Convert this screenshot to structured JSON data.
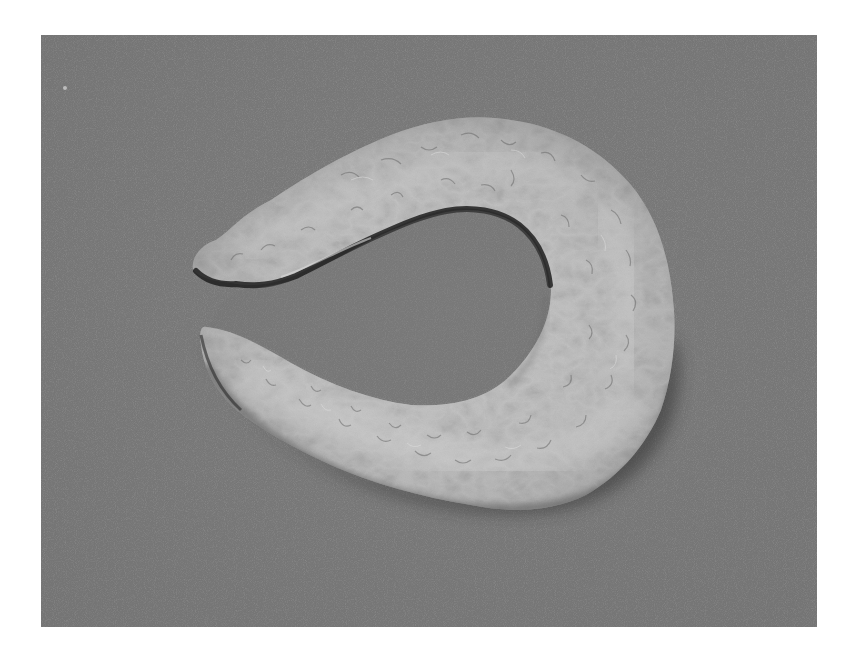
{
  "figure": {
    "alt": "Grayscale photograph of a C-shaped (horseshoe) ring-like specimen on a gray background",
    "colors": {
      "page_background": "#ffffff",
      "photo_background": "#7a7a7a",
      "specimen_highlight": "#cfcfcf",
      "specimen_midtone": "#b4b4b4",
      "specimen_shadow": "#3a3a3a",
      "inner_hole": "#6e6e6e"
    },
    "frame": {
      "left": 41,
      "top": 35,
      "width": 776,
      "height": 592
    }
  }
}
